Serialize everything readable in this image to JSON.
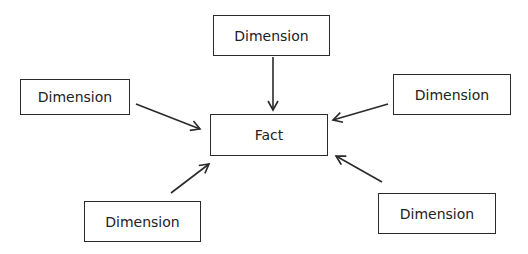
{
  "diagram": {
    "type": "star-schema",
    "center": {
      "label": "Fact"
    },
    "dimensions": [
      {
        "position": "top",
        "label": "Dimension"
      },
      {
        "position": "left",
        "label": "Dimension"
      },
      {
        "position": "right",
        "label": "Dimension"
      },
      {
        "position": "bottom-left",
        "label": "Dimension"
      },
      {
        "position": "bottom-right",
        "label": "Dimension"
      }
    ],
    "colors": {
      "stroke": "#2a2a2a",
      "text": "#222222",
      "background": "#ffffff"
    }
  }
}
